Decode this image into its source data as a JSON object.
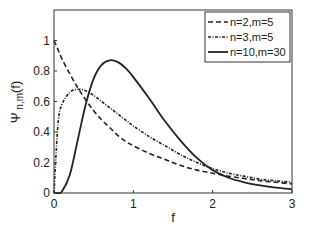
{
  "chart_data": {
    "type": "line",
    "title": "",
    "xlabel": "f",
    "ylabel": "Ψ n,m (f)",
    "xlim": [
      0,
      3
    ],
    "ylim": [
      0,
      1.2
    ],
    "xticks": [
      "0",
      "1",
      "2",
      "3"
    ],
    "yticks": [
      "0",
      "0.2",
      "0.4",
      "0.6",
      "0.8",
      "1"
    ],
    "grid": false,
    "legend_position": "upper right",
    "x": [
      0,
      0.05,
      0.1,
      0.2,
      0.3,
      0.4,
      0.5,
      0.6,
      0.7,
      0.8,
      0.9,
      1.0,
      1.2,
      1.4,
      1.6,
      1.8,
      2.0,
      2.2,
      2.4,
      2.6,
      2.8,
      3.0
    ],
    "series": [
      {
        "name": "n=2,m=5",
        "style": "dashed",
        "values": [
          1.0,
          0.94,
          0.88,
          0.78,
          0.69,
          0.61,
          0.54,
          0.48,
          0.43,
          0.38,
          0.34,
          0.31,
          0.26,
          0.22,
          0.18,
          0.15,
          0.13,
          0.11,
          0.095,
          0.08,
          0.07,
          0.06
        ]
      },
      {
        "name": "n=3,m=5",
        "style": "dashdot",
        "values": [
          0.0,
          0.45,
          0.58,
          0.66,
          0.68,
          0.67,
          0.64,
          0.6,
          0.56,
          0.52,
          0.48,
          0.44,
          0.37,
          0.31,
          0.25,
          0.2,
          0.16,
          0.13,
          0.11,
          0.09,
          0.08,
          0.07
        ]
      },
      {
        "name": "n=10,m=30",
        "style": "solid",
        "values": [
          0.0,
          0.0,
          0.01,
          0.12,
          0.35,
          0.58,
          0.75,
          0.84,
          0.87,
          0.86,
          0.82,
          0.76,
          0.62,
          0.47,
          0.34,
          0.23,
          0.15,
          0.1,
          0.07,
          0.05,
          0.035,
          0.025
        ]
      }
    ]
  }
}
